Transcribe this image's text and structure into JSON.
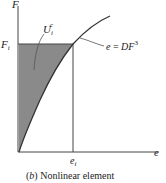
{
  "figure": {
    "caption_prefix": "(",
    "caption_letter": "b",
    "caption_suffix": ") Nonlinear element",
    "axes": {
      "y_label": "F",
      "x_label": "e"
    },
    "markers": {
      "force_level_label": "F",
      "force_level_sub": "i",
      "deformation_level_label": "e",
      "deformation_level_sub": "i"
    },
    "region_label": {
      "symbol": "U",
      "sub": "i",
      "sup": "c"
    },
    "curve_equation": {
      "lhs": "e",
      "eq": " = ",
      "rhs": "DF",
      "exponent": "3"
    },
    "colors": {
      "shade": "#8a8a8a",
      "line": "#333333",
      "background": "#ffffff"
    }
  }
}
